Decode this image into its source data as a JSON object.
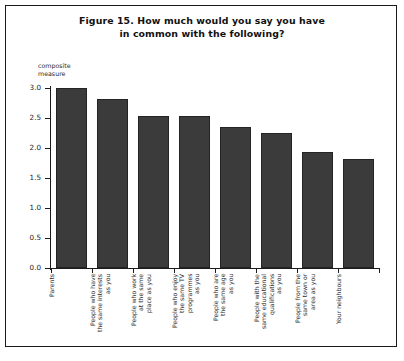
{
  "figure": {
    "title_line1": "Figure 15. How much would you say you have",
    "title_line2": "in common with the following?"
  },
  "axis": {
    "y_title_line1": "composite",
    "y_title_line2": "measure"
  },
  "colors": {
    "bar_fill": "#3b3b3b",
    "bar_border": "#242424",
    "axis": "#1b1b1b",
    "background": "#ffffff",
    "frame": "#1b1b1b"
  },
  "chart_data": {
    "type": "bar",
    "title": "Figure 15. How much would you say you have in common with the following?",
    "xlabel": "",
    "ylabel": "composite measure",
    "ylim": [
      0.0,
      3.0
    ],
    "yticks": [
      "0.0",
      "0.5",
      "1.0",
      "1.5",
      "2.0",
      "2.5",
      "3.0"
    ],
    "ytick_values": [
      0.0,
      0.5,
      1.0,
      1.5,
      2.0,
      2.5,
      3.0
    ],
    "grid": false,
    "legend": null,
    "categories": [
      "Parents",
      "People who have the same interests as you",
      "People who work at the same place as you",
      "People who enjoy the same TV programmes as you",
      "People who are the same age as you",
      "People with the same educational qualifications as you",
      "People from the same town or area as you",
      "Your neighbours"
    ],
    "category_lines": [
      [
        "Parents"
      ],
      [
        "People who have",
        "the same interests",
        "as you"
      ],
      [
        "People who work",
        "at the same",
        "place as you"
      ],
      [
        "People who enjoy",
        "the same TV",
        "programmes",
        "as you"
      ],
      [
        "People who are",
        "the same age",
        "as you"
      ],
      [
        "People with the",
        "same educational",
        "qualifications",
        "as you"
      ],
      [
        "People from the",
        "same town or",
        "area as you"
      ],
      [
        "Your neighbours"
      ]
    ],
    "values": [
      3.0,
      2.82,
      2.53,
      2.53,
      2.35,
      2.25,
      1.93,
      1.82
    ]
  }
}
